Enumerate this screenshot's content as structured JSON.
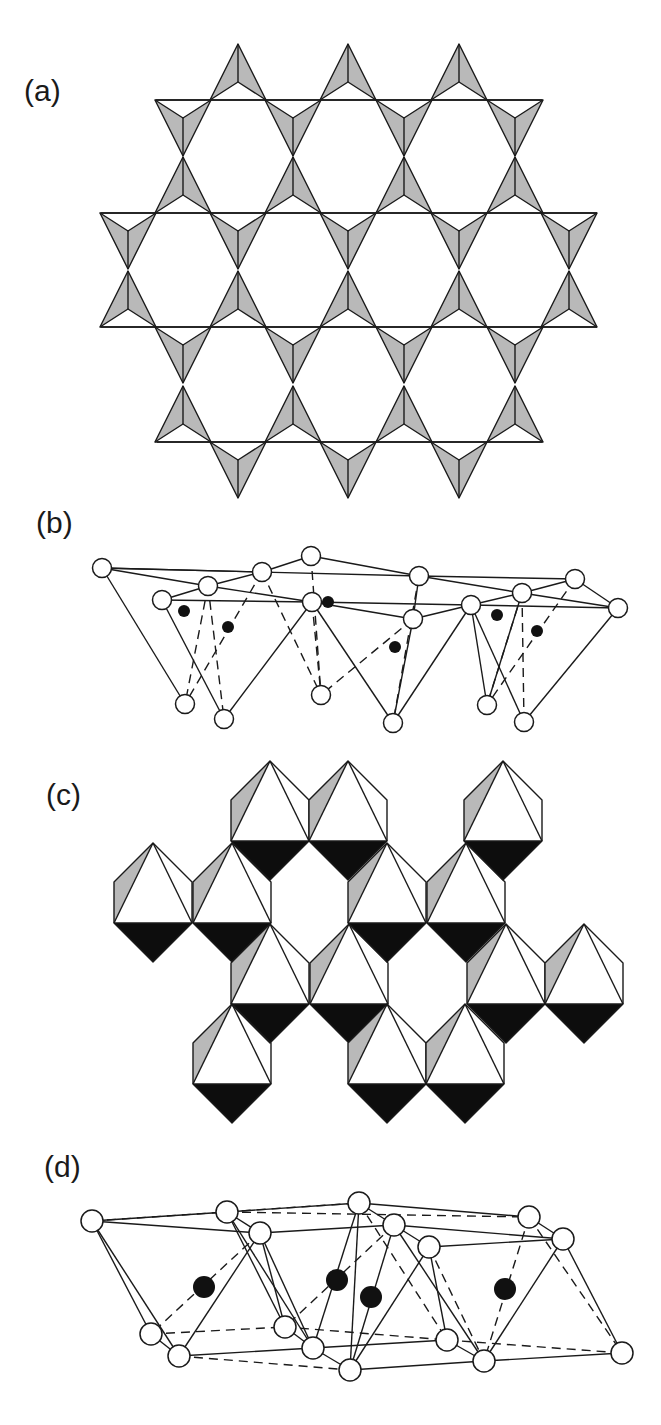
{
  "figure": {
    "panels": [
      {
        "id": "a",
        "label": "(a)",
        "description": "Corner-sharing tetrahedra forming a kagome net (polyhedral view)"
      },
      {
        "id": "b",
        "label": "(b)",
        "description": "Ball-and-stick view of tetrahedral layer"
      },
      {
        "id": "c",
        "label": "(c)",
        "description": "Edge-sharing octahedra layer (polyhedral view)"
      },
      {
        "id": "d",
        "label": "(d)",
        "description": "Ball-and-stick view of octahedral layer"
      }
    ],
    "colors": {
      "line": "#1a1a1a",
      "facet_gray": "#b9b9b9",
      "facet_black": "#0d0d0d",
      "metal_atom": "#111111",
      "anion_atom": "#ffffff"
    }
  },
  "panel_a": {
    "tri_half_width": 28,
    "tri_height": 56,
    "inner_depth": 38,
    "lines": [
      {
        "y": 100,
        "x1": 156,
        "x2": 542
      },
      {
        "y": 213,
        "x1": 101,
        "x2": 597
      },
      {
        "y": 327,
        "x1": 101,
        "x2": 597
      },
      {
        "y": 442,
        "x1": 157,
        "x2": 542
      }
    ],
    "up_triangles": [
      {
        "base_y": 100,
        "centers": [
          238,
          348,
          459
        ]
      },
      {
        "base_y": 213,
        "centers": [
          183,
          293,
          404,
          515
        ]
      },
      {
        "base_y": 327,
        "centers": [
          128,
          238,
          348,
          459,
          569
        ]
      },
      {
        "base_y": 442,
        "centers": [
          183,
          293,
          404,
          515
        ]
      }
    ],
    "down_triangles": [
      {
        "top_y": 100,
        "centers": [
          183,
          293,
          404,
          515
        ]
      },
      {
        "top_y": 213,
        "centers": [
          128,
          238,
          348,
          459,
          569
        ]
      },
      {
        "top_y": 327,
        "centers": [
          183,
          293,
          404,
          515
        ]
      },
      {
        "top_y": 442,
        "centers": [
          238,
          348,
          459
        ]
      }
    ]
  },
  "panel_b": {
    "anions": [
      [
        102,
        568
      ],
      [
        262,
        572
      ],
      [
        311,
        556
      ],
      [
        208,
        586
      ],
      [
        162,
        600
      ],
      [
        312,
        602
      ],
      [
        419,
        576
      ],
      [
        413,
        619
      ],
      [
        471,
        605
      ],
      [
        522,
        593
      ],
      [
        575,
        579
      ],
      [
        618,
        608
      ],
      [
        185,
        704
      ],
      [
        224,
        719
      ],
      [
        321,
        695
      ],
      [
        393,
        723
      ],
      [
        487,
        705
      ],
      [
        524,
        722
      ]
    ],
    "cations": [
      [
        184,
        611
      ],
      [
        228,
        627
      ],
      [
        328,
        602
      ],
      [
        395,
        647
      ],
      [
        497,
        615
      ],
      [
        537,
        631
      ]
    ],
    "solid_edges": [
      [
        0,
        1
      ],
      [
        0,
        3
      ],
      [
        0,
        6
      ],
      [
        1,
        2
      ],
      [
        1,
        3
      ],
      [
        2,
        6
      ],
      [
        3,
        4
      ],
      [
        3,
        5
      ],
      [
        4,
        5
      ],
      [
        5,
        8
      ],
      [
        5,
        7
      ],
      [
        7,
        8
      ],
      [
        6,
        7
      ],
      [
        6,
        9
      ],
      [
        6,
        10
      ],
      [
        9,
        10
      ],
      [
        9,
        8
      ],
      [
        9,
        11
      ],
      [
        8,
        11
      ],
      [
        10,
        11
      ],
      [
        0,
        12
      ],
      [
        4,
        13
      ],
      [
        5,
        13
      ],
      [
        5,
        15
      ],
      [
        7,
        15
      ],
      [
        8,
        15
      ],
      [
        8,
        16
      ],
      [
        11,
        17
      ],
      [
        8,
        17
      ],
      [
        9,
        16
      ]
    ],
    "dashed_edges": [
      [
        3,
        13
      ],
      [
        3,
        12
      ],
      [
        1,
        12
      ],
      [
        2,
        14
      ],
      [
        1,
        14
      ],
      [
        7,
        14
      ],
      [
        6,
        15
      ],
      [
        9,
        17
      ],
      [
        10,
        16
      ],
      [
        9,
        16
      ],
      [
        5,
        14
      ]
    ]
  },
  "panel_c": {
    "half_width": 39,
    "shoulder_dy": 39,
    "base_dy": 80,
    "bottom_dy": 119,
    "octahedra": [
      {
        "apex_y": 761,
        "centers": [
          270,
          348,
          503
        ]
      },
      {
        "apex_y": 843,
        "centers": [
          153,
          232,
          387,
          466
        ]
      },
      {
        "apex_y": 924,
        "centers": [
          270,
          349,
          506,
          584
        ]
      },
      {
        "apex_y": 1004,
        "centers": [
          232,
          387,
          465
        ]
      }
    ]
  },
  "panel_d": {
    "anions": [
      [
        92,
        1221
      ],
      [
        227,
        1212
      ],
      [
        260,
        1233
      ],
      [
        359,
        1203
      ],
      [
        394,
        1225
      ],
      [
        429,
        1247
      ],
      [
        529,
        1217
      ],
      [
        563,
        1239
      ],
      [
        151,
        1334
      ],
      [
        179,
        1356
      ],
      [
        285,
        1327
      ],
      [
        313,
        1348
      ],
      [
        350,
        1370
      ],
      [
        447,
        1340
      ],
      [
        484,
        1361
      ],
      [
        622,
        1353
      ]
    ],
    "cations": [
      [
        204,
        1287
      ],
      [
        337,
        1280
      ],
      [
        371,
        1297
      ],
      [
        505,
        1289
      ]
    ],
    "solid_edges": [
      [
        0,
        1
      ],
      [
        0,
        2
      ],
      [
        0,
        8
      ],
      [
        0,
        9
      ],
      [
        1,
        3
      ],
      [
        1,
        2
      ],
      [
        2,
        4
      ],
      [
        3,
        4
      ],
      [
        3,
        6
      ],
      [
        4,
        5
      ],
      [
        4,
        7
      ],
      [
        5,
        7
      ],
      [
        6,
        7
      ],
      [
        1,
        10
      ],
      [
        1,
        11
      ],
      [
        2,
        11
      ],
      [
        2,
        9
      ],
      [
        9,
        11
      ],
      [
        8,
        9
      ],
      [
        11,
        12
      ],
      [
        3,
        12
      ],
      [
        4,
        14
      ],
      [
        5,
        13
      ],
      [
        5,
        12
      ],
      [
        7,
        14
      ],
      [
        7,
        15
      ],
      [
        12,
        14
      ],
      [
        13,
        14
      ],
      [
        11,
        13
      ],
      [
        14,
        15
      ],
      [
        3,
        11
      ],
      [
        4,
        12
      ],
      [
        2,
        10
      ],
      [
        10,
        11
      ]
    ],
    "dashed_edges": [
      [
        0,
        3
      ],
      [
        2,
        8
      ],
      [
        8,
        10
      ],
      [
        10,
        13
      ],
      [
        1,
        6
      ],
      [
        4,
        10
      ],
      [
        5,
        14
      ],
      [
        6,
        15
      ],
      [
        6,
        14
      ],
      [
        13,
        15
      ],
      [
        9,
        12
      ],
      [
        3,
        13
      ]
    ]
  }
}
